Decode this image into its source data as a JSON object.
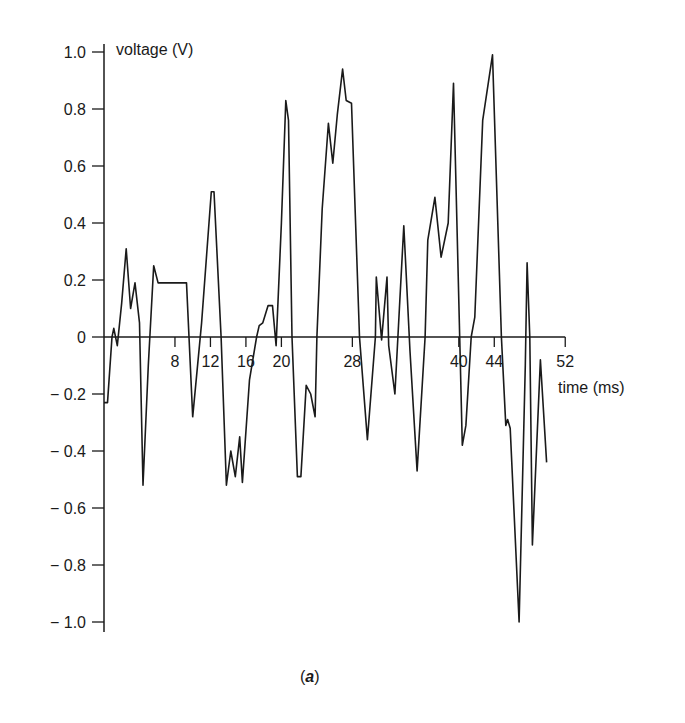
{
  "chart_data": {
    "type": "line",
    "title": "",
    "caption": "(a)",
    "xlabel": "time (ms)",
    "ylabel": "voltage (V)",
    "xlim": [
      0,
      52
    ],
    "ylim": [
      -1.0,
      1.0
    ],
    "grid": false,
    "legend": null,
    "x_ticks": [
      8,
      12,
      16,
      20,
      28,
      40,
      44,
      52
    ],
    "x_tick_labels": [
      "8",
      "12",
      "16",
      "20",
      "28",
      "40",
      "44",
      "52"
    ],
    "y_ticks": [
      1.0,
      0.8,
      0.6,
      0.4,
      0.2,
      0,
      -0.2,
      -0.4,
      -0.6,
      -0.8,
      -1.0
    ],
    "y_tick_labels": [
      "1.0",
      "0.8",
      "0.6",
      "0.4",
      "0.2",
      "0",
      "− 0.2",
      "− 0.4",
      "− 0.6",
      "− 0.8",
      "− 1.0"
    ],
    "series": [
      {
        "name": "voltage",
        "x": [
          0.0,
          0.4,
          0.9,
          1.1,
          1.5,
          2.0,
          2.5,
          3.0,
          3.5,
          4.0,
          4.4,
          5.0,
          5.6,
          6.1,
          7.0,
          8.5,
          9.3,
          10.0,
          11.0,
          12.1,
          12.4,
          13.2,
          13.8,
          14.3,
          14.8,
          15.3,
          15.6,
          16.4,
          17.2,
          17.5,
          17.9,
          18.5,
          19.0,
          19.4,
          20.0,
          20.5,
          20.8,
          21.2,
          21.8,
          22.2,
          22.8,
          23.3,
          23.8,
          24.0,
          24.6,
          25.3,
          25.8,
          26.3,
          26.9,
          27.3,
          27.9,
          28.8,
          29.7,
          30.6,
          30.7,
          31.3,
          31.9,
          32.1,
          32.8,
          33.3,
          33.8,
          34.5,
          35.3,
          36.2,
          36.5,
          37.3,
          38.0,
          38.8,
          39.4,
          40.1,
          40.4,
          40.8,
          41.4,
          41.8,
          42.7,
          43.8,
          44.8,
          45.3,
          45.5,
          45.8,
          46.8,
          47.5,
          47.7,
          48.0,
          48.3,
          49.2,
          49.9
        ],
        "y": [
          -0.23,
          -0.23,
          0.0,
          0.03,
          -0.03,
          0.12,
          0.31,
          0.1,
          0.19,
          0.05,
          -0.52,
          -0.1,
          0.25,
          0.19,
          0.19,
          0.19,
          0.19,
          -0.28,
          0.05,
          0.51,
          0.51,
          0.0,
          -0.52,
          -0.4,
          -0.49,
          -0.35,
          -0.51,
          -0.15,
          0.0,
          0.04,
          0.05,
          0.11,
          0.11,
          -0.03,
          0.4,
          0.83,
          0.76,
          0.0,
          -0.49,
          -0.49,
          -0.17,
          -0.2,
          -0.28,
          0.0,
          0.45,
          0.75,
          0.61,
          0.78,
          0.94,
          0.83,
          0.82,
          0.0,
          -0.36,
          0.0,
          0.21,
          -0.01,
          0.21,
          -0.03,
          -0.2,
          0.1,
          0.39,
          -0.05,
          -0.47,
          0.0,
          0.34,
          0.49,
          0.28,
          0.4,
          0.89,
          0.0,
          -0.38,
          -0.31,
          0.0,
          0.07,
          0.76,
          0.99,
          0.0,
          -0.31,
          -0.29,
          -0.32,
          -1.0,
          -0.1,
          0.26,
          0.0,
          -0.73,
          -0.08,
          -0.44
        ]
      }
    ]
  }
}
